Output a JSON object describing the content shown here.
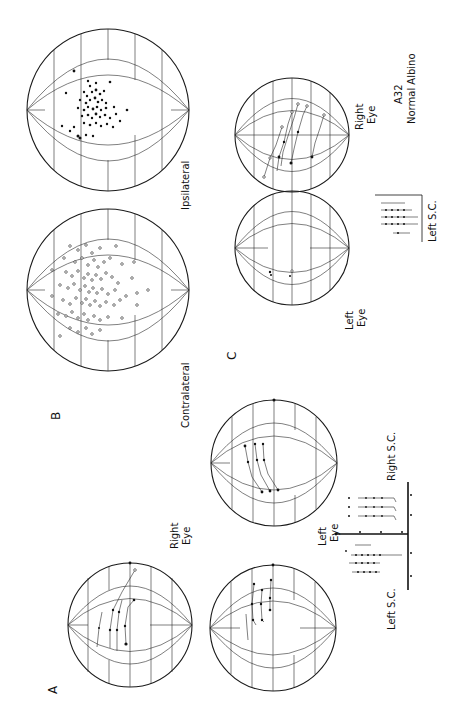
{
  "figure": {
    "orientation": "rotated-90-ccw",
    "panels": [
      {
        "id": "A",
        "letter": "A",
        "labels": {
          "right_eye_line1": "Right",
          "right_eye_line2": "Eye",
          "left_eye_line1": "Left",
          "left_eye_line2": "Eye",
          "left_sc": "Left S.C.",
          "right_sc": "Right S.C."
        }
      },
      {
        "id": "B",
        "letter": "B",
        "labels": {
          "contralateral": "Contralateral",
          "ipsilateral": "Ipsilateral"
        }
      },
      {
        "id": "C",
        "letter": "C",
        "labels": {
          "left_eye_line1": "Left",
          "left_eye_line2": "Eye",
          "right_eye_line1": "Right",
          "right_eye_line2": "Eye",
          "specimen_line1": "A32",
          "specimen_line2": "Normal Albino",
          "left_sc": "Left S.C."
        }
      }
    ]
  },
  "colors": {
    "ink": "#111111",
    "paper": "#ffffff"
  }
}
